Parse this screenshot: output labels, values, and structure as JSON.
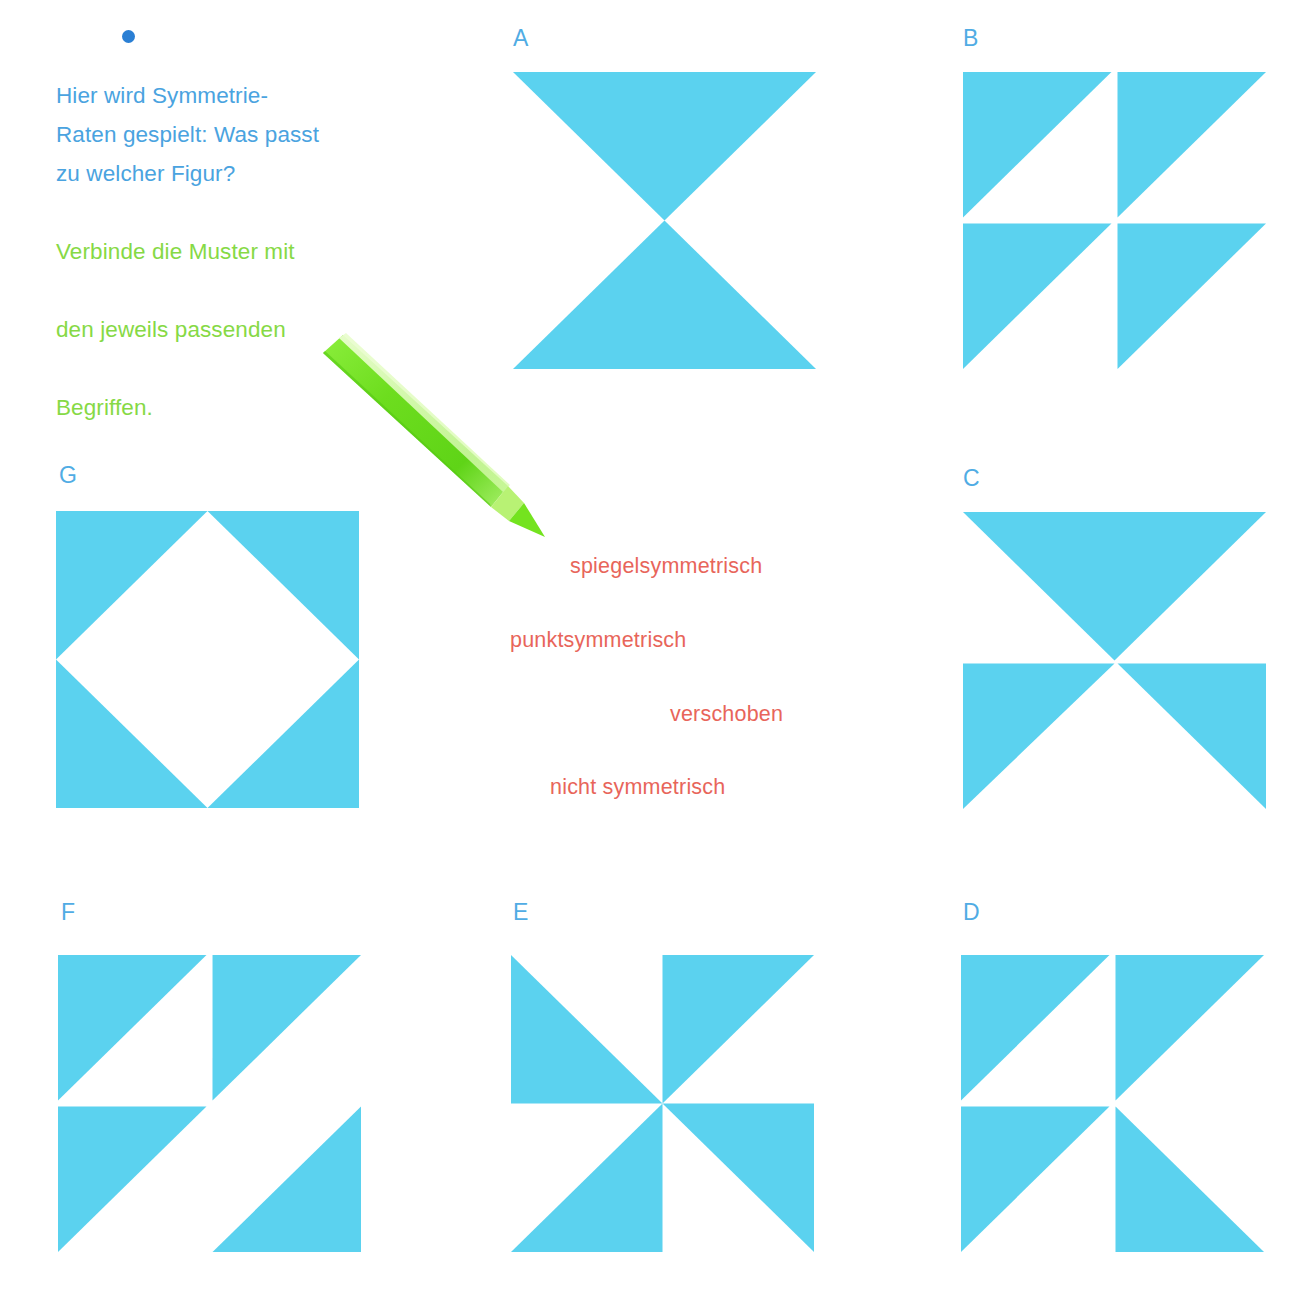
{
  "colors": {
    "figure_blue": "#5bd2ef",
    "label_blue": "#50ace4",
    "text_blue": "#4aa3e0",
    "text_green": "#86d945",
    "term_red": "#e8655a",
    "bullet_blue": "#2a7fd4",
    "pen_green": "#7ae02a",
    "background": "#ffffff"
  },
  "instructions": {
    "bullet": "•",
    "blue_text": "Hier wird Symmetrie-Raten gespielt: Was passt zu welcher Figur?",
    "blue_lines": [
      "Hier wird Symmetrie-",
      "Raten gespielt: Was passt",
      "zu welcher Figur?"
    ],
    "green_text": "Verbinde die Muster mit den jeweils passenden Begriffen.",
    "green_lines": [
      "Verbinde die Muster mit",
      "den jeweils passenden",
      "Begriffen."
    ]
  },
  "terms": [
    {
      "label": "spiegelsymmetrisch"
    },
    {
      "label": "punktsymmetrisch"
    },
    {
      "label": "verschoben"
    },
    {
      "label": "nicht symmetrisch"
    }
  ],
  "figures": [
    {
      "id": "A",
      "label": "A",
      "description": "hourglass: downward triangle on top, upward triangle below, meeting at center"
    },
    {
      "id": "B",
      "label": "B",
      "description": "2x2 grid, each quadrant an upper-left right triangle (translated pattern)"
    },
    {
      "id": "C",
      "label": "C",
      "description": "full-width downward triangle on top, two bottom corner triangles below"
    },
    {
      "id": "D",
      "label": "D",
      "description": "2x2 grid: TL upper-left, TR upper-left, BL upper-left, BR upper-right triangles"
    },
    {
      "id": "E",
      "label": "E",
      "description": "pinwheel: four triangles rotated 90 degrees around the center"
    },
    {
      "id": "F",
      "label": "F",
      "description": "2x2 grid: TL upper-left, TR upper-left, BL upper-left, BR lower-right triangles"
    },
    {
      "id": "G",
      "label": "G",
      "description": "blue square with a white diamond in the middle (four corner triangles)"
    }
  ],
  "pen": {
    "name": "green felt-tip marker",
    "color": "#7ae02a"
  }
}
